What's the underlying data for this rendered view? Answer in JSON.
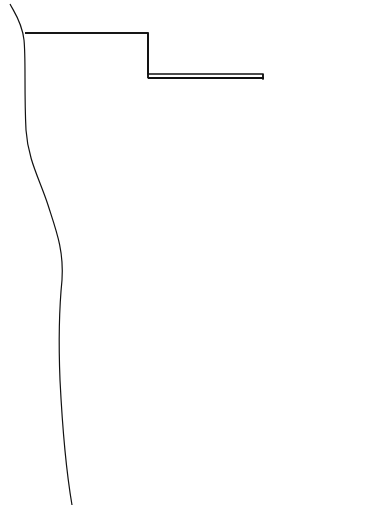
{
  "figure": {
    "type": "archaeological site plan",
    "labels": {
      "plaster_floor": "Plaster floor",
      "b1_13th": "B1-13th",
      "br_f5b": "BR-F5b",
      "br_f5a": "BR-F5a",
      "bulldozer_cut_1": "Bulldozer",
      "bulldozer_cut_2": "Cut",
      "br_f8": "BR-F8",
      "br_f7": "BR-F7",
      "b1_10th": "B1-10th",
      "br_f6": "BR-F6",
      "b18th_a": "B18th-a",
      "b1_8th_b": "B1-8th-b",
      "b1_12th": "B1-12th",
      "b1_8th": "B1-8th",
      "b1_9th": "B1-9th",
      "br_f4": "BR-F4",
      "br_f3_1": "BR-",
      "br_f3_2": "F3",
      "br_f1": "BR-F1",
      "br_f2": "BR-F2",
      "b1_11th": "B1-11th",
      "not_cleared_1a": "Not Cleared",
      "not_cleared_1b": "to Bedrock",
      "not_cleared_2": "Not Cleared to Bedrock",
      "north": "N"
    },
    "scale_bar": {
      "ticks": [
        "0",
        "1",
        "2",
        "3 meters"
      ]
    }
  }
}
